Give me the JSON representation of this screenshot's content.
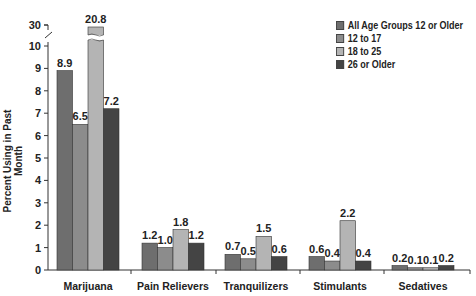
{
  "chart_data": {
    "type": "bar",
    "title": "",
    "xlabel": "",
    "ylabel": "Percent Using in Past Month",
    "ylim": [
      0,
      10
    ],
    "y_break": {
      "from": 10,
      "to": 30
    },
    "yticks": [
      0,
      1,
      2,
      3,
      4,
      5,
      6,
      7,
      8,
      9,
      10,
      30
    ],
    "grid": false,
    "legend_position": "top-right",
    "categories": [
      "Marijuana",
      "Pain Relievers",
      "Tranquilizers",
      "Stimulants",
      "Sedatives"
    ],
    "series": [
      {
        "name": "All Age Groups 12 or Older",
        "color": "#6e6e6e",
        "values": [
          8.9,
          1.2,
          0.7,
          0.6,
          0.2
        ]
      },
      {
        "name": "12 to 17",
        "color": "#8c8c8c",
        "values": [
          6.5,
          1.0,
          0.5,
          0.4,
          0.1
        ]
      },
      {
        "name": "18 to 25",
        "color": "#b4b4b4",
        "values": [
          20.8,
          1.8,
          1.5,
          2.2,
          0.1
        ]
      },
      {
        "name": "26 or Older",
        "color": "#444444",
        "values": [
          7.2,
          1.2,
          0.6,
          0.4,
          0.2
        ]
      }
    ],
    "value_labels": [
      [
        "8.9",
        "6.5",
        "20.8",
        "7.2"
      ],
      [
        "1.2",
        "1.0",
        "1.8",
        "1.2"
      ],
      [
        "0.7",
        "0.5",
        "1.5",
        "0.6"
      ],
      [
        "0.6",
        "0.4",
        "2.2",
        "0.4"
      ],
      [
        "0.2",
        "0.1",
        "0.1",
        "0.2"
      ]
    ]
  }
}
